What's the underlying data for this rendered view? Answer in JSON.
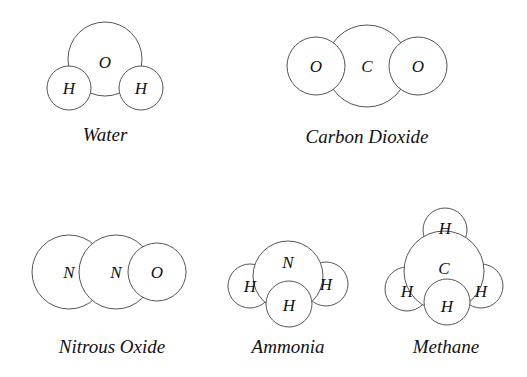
{
  "molecules": [
    {
      "name": "Water",
      "label_pos": [
        105,
        141
      ],
      "atoms": [
        {
          "symbol": "O",
          "cx": 105,
          "cy": 59,
          "r": 37,
          "ty": 62
        },
        {
          "symbol": "H",
          "cx": 69,
          "cy": 88,
          "r": 22,
          "ty": 88
        },
        {
          "symbol": "H",
          "cx": 141,
          "cy": 88,
          "r": 22,
          "ty": 88
        }
      ]
    },
    {
      "name": "Carbon Dioxide",
      "label_pos": [
        367,
        143
      ],
      "atoms": [
        {
          "symbol": "C",
          "cx": 367,
          "cy": 66,
          "r": 41,
          "ty": 66
        },
        {
          "symbol": "O",
          "cx": 316,
          "cy": 66,
          "r": 29,
          "ty": 66
        },
        {
          "symbol": "O",
          "cx": 418,
          "cy": 66,
          "r": 29,
          "ty": 66
        }
      ]
    },
    {
      "name": "Nitrous Oxide",
      "label_pos": [
        112,
        353
      ],
      "atoms": [
        {
          "symbol": "N",
          "cx": 69,
          "cy": 272,
          "r": 37,
          "ty": 272
        },
        {
          "symbol": "N",
          "cx": 116,
          "cy": 272,
          "r": 37,
          "ty": 272
        },
        {
          "symbol": "O",
          "cx": 157,
          "cy": 272,
          "r": 29,
          "ty": 272
        }
      ]
    },
    {
      "name": "Ammonia",
      "label_pos": [
        288,
        353
      ],
      "atoms": [
        {
          "symbol": "H",
          "cx": 250,
          "cy": 286,
          "r": 22,
          "ty": 286
        },
        {
          "symbol": "H",
          "cx": 326,
          "cy": 284,
          "r": 22,
          "ty": 284
        },
        {
          "symbol": "N",
          "cx": 288,
          "cy": 276,
          "r": 35,
          "ty": 262
        },
        {
          "symbol": "H",
          "cx": 289,
          "cy": 304,
          "r": 23,
          "ty": 305
        }
      ]
    },
    {
      "name": "Methane",
      "label_pos": [
        446,
        353
      ],
      "atoms": [
        {
          "symbol": "H",
          "cx": 445,
          "cy": 230,
          "r": 22,
          "ty": 228
        },
        {
          "symbol": "H",
          "cx": 407,
          "cy": 289,
          "r": 22,
          "ty": 291
        },
        {
          "symbol": "H",
          "cx": 481,
          "cy": 286,
          "r": 22,
          "ty": 291
        },
        {
          "symbol": "C",
          "cx": 444,
          "cy": 271,
          "r": 40,
          "ty": 268
        },
        {
          "symbol": "H",
          "cx": 447,
          "cy": 302,
          "r": 23,
          "ty": 306
        }
      ]
    }
  ]
}
